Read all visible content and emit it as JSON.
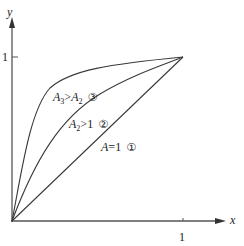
{
  "axes": {
    "x_label": "x",
    "y_label": "y",
    "x_tick_label": "1",
    "y_tick_label": "1"
  },
  "curves": [
    {
      "id": "1",
      "var": "A",
      "sub": "",
      "op": "=",
      "rhs": "1",
      "rhs_sub": "",
      "marker": "①",
      "shape": "straight line from (0,0) to (1,1)"
    },
    {
      "id": "2",
      "var": "A",
      "sub": "2",
      "op": ">",
      "rhs": "1",
      "rhs_sub": "",
      "marker": "②",
      "shape": "concave curve from (0,0) to (1,1)"
    },
    {
      "id": "3",
      "var": "A",
      "sub": "3",
      "op": ">",
      "rhs": "A",
      "rhs_sub": "2",
      "marker": "③",
      "shape": "strongly concave curve from (0,0) to (1,1)"
    }
  ],
  "colors": {
    "line": "#3a3a3a",
    "axis": "#555555",
    "text": "#222222"
  }
}
